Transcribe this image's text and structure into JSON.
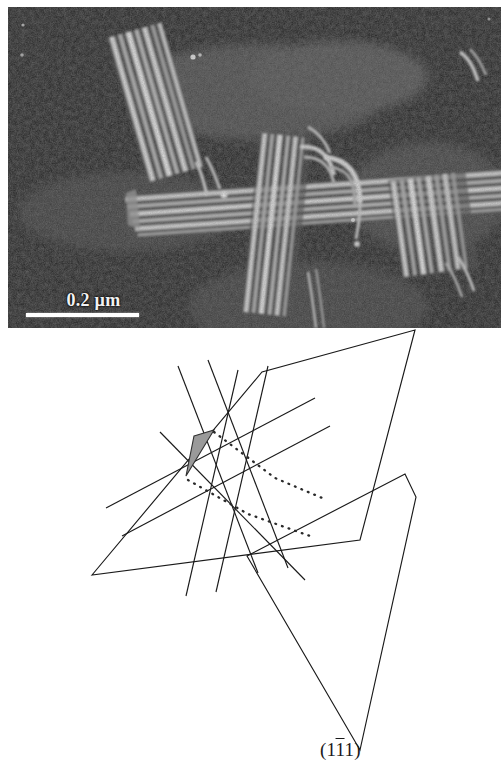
{
  "figure": {
    "kind": "tem-micrograph-with-schematic",
    "panels": [
      "tem-micrograph",
      "crystallographic-schematic"
    ]
  },
  "tem": {
    "scale_bar": {
      "label": "0.2 µm",
      "value": "0.2",
      "unit": "µm",
      "bar_color": "#ffffff",
      "bar_length_px": 113
    },
    "background_color": "#2a2a2a",
    "feature_color": "#e8e8e8",
    "description_icons": {
      "lamellae": "striped-lamellae-icon"
    }
  },
  "diagram": {
    "labels": {
      "band_a": "A",
      "band_b": "B",
      "band_c": "C"
    },
    "miller_index": {
      "open_paren": "(",
      "digit1": "1",
      "digit2_bar": "1",
      "digit3": "1",
      "close_paren": ")",
      "full": "(1̅1̅1)"
    },
    "colors": {
      "line": "#1a1a1a",
      "shaded_triangle_fill": "#9a9a9a",
      "shaded_triangle_stroke": "#303030",
      "background": "#ffffff"
    },
    "geometry": {
      "plane_upper_vertices": "92,575 262,372 415,330 360,540",
      "plane_lower_vertices": "247,556 405,474 416,497 360,750",
      "band_count": 3,
      "dotted_line_count": 2
    }
  }
}
